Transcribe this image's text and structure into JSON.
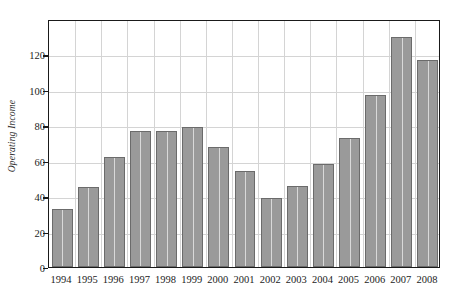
{
  "chart_data": {
    "type": "bar",
    "title": "",
    "subtitle": "",
    "xlabel": "",
    "ylabel": "Operating Income",
    "categories": [
      "1994",
      "1995",
      "1996",
      "1997",
      "1998",
      "1999",
      "2000",
      "2001",
      "2002",
      "2003",
      "2004",
      "2005",
      "2006",
      "2007",
      "2008"
    ],
    "values": [
      33,
      45,
      62,
      77,
      77,
      79,
      68,
      54,
      39,
      46,
      58,
      73,
      97,
      130,
      117
    ],
    "ylim": [
      0,
      140
    ],
    "xlim": [
      0,
      15
    ],
    "y_ticks": [
      0,
      20,
      40,
      60,
      80,
      100,
      120
    ],
    "y_tick_labels": [
      "0",
      "20",
      "40",
      "60",
      "80",
      "100",
      "120"
    ],
    "grid": true,
    "grid_axis": "both",
    "legend": false,
    "legend_position": "none",
    "series": [
      {
        "name": "Operating Income",
        "values": [
          33,
          45,
          62,
          77,
          77,
          79,
          68,
          54,
          39,
          46,
          58,
          73,
          97,
          130,
          117
        ]
      }
    ],
    "annotations": []
  },
  "style": {
    "bar_fill_color": "#9a9a9a",
    "bar_edge_color": "#6b6b6b",
    "grid_color": "#d4d4d4",
    "frame_color": "#1a1a1a",
    "background_color": "#ffffff",
    "text_color": "#1c1c1c"
  }
}
